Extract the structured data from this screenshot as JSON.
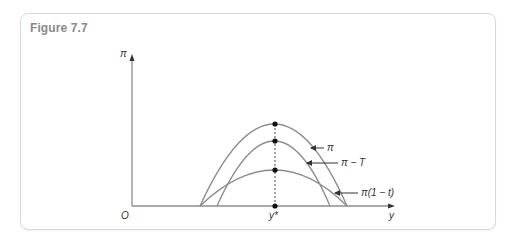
{
  "figure": {
    "title": "Figure 7.7"
  },
  "axes": {
    "y_label": "π",
    "x_label": "y",
    "origin_label": "O",
    "marker_label": "y*"
  },
  "curves": [
    {
      "name": "pi",
      "label": "π"
    },
    {
      "name": "pi-minus-T",
      "label": "π − T"
    },
    {
      "name": "pi-times-one-minus-t",
      "label": "π(1 − t)"
    }
  ],
  "colors": {
    "curve": "#8c8c8c",
    "axis": "#8c8c8c",
    "title": "#8a8a8a",
    "border": "#d9d9d9",
    "dot": "#111111"
  }
}
